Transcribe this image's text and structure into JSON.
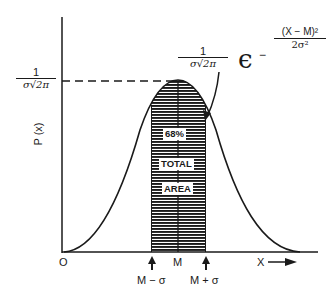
{
  "diagram": {
    "y_axis_label": "P (x)",
    "x_axis_label": "X",
    "origin_label": "O",
    "peak_label": {
      "numerator": "1",
      "denominator": "σ√2π"
    },
    "formula": {
      "coefficient": {
        "numerator": "1",
        "denominator": "σ√2π"
      },
      "base": "ϵ",
      "exponent_sign": "−",
      "exponent": {
        "numerator": "(X − M)²",
        "denominator": "2σ²"
      }
    },
    "shaded_region_labels": [
      "68%",
      "TOTAL",
      "AREA"
    ],
    "x_markers": {
      "mean": "M",
      "minus_sigma": "M − σ",
      "plus_sigma": "M + σ"
    },
    "colors": {
      "ink": "#1a1a1a",
      "background": "#ffffff"
    }
  }
}
